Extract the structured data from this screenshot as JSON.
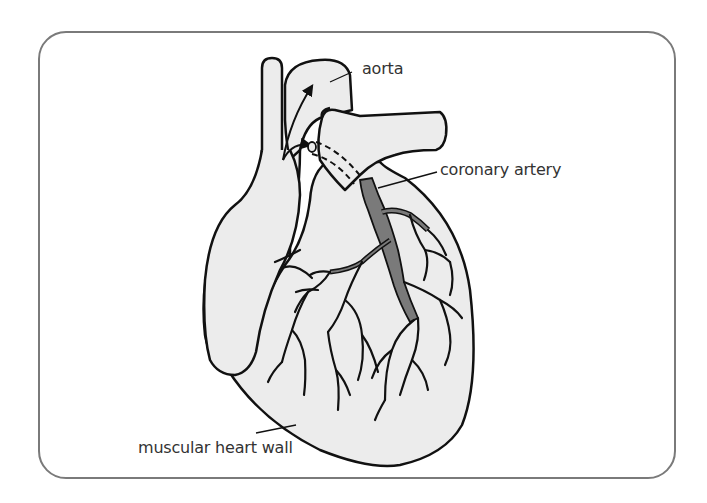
{
  "diagram": {
    "subject": "heart",
    "colors": {
      "frame": "#7a7a7a",
      "heart_fill": "#ececec",
      "outline": "#111111",
      "coronary_artery": "#7a7a7a",
      "label_text": "#333333"
    },
    "labels": {
      "aorta": "aorta",
      "coronary_artery": "coronary artery",
      "muscular_heart_wall": "muscular heart wall"
    }
  }
}
